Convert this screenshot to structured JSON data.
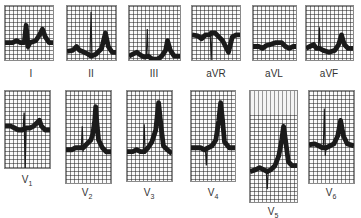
{
  "figure": {
    "type": "12-lead ECG strips",
    "limb_leads": [
      {
        "id": "I",
        "label": "I"
      },
      {
        "id": "II",
        "label": "II"
      },
      {
        "id": "III",
        "label": "III"
      },
      {
        "id": "aVR",
        "label": "aVR"
      },
      {
        "id": "aVL",
        "label": "aVL"
      },
      {
        "id": "aVF",
        "label": "aVF"
      }
    ],
    "precordial_leads": [
      {
        "id": "V1",
        "label": "V",
        "sub": "1"
      },
      {
        "id": "V2",
        "label": "V",
        "sub": "2"
      },
      {
        "id": "V3",
        "label": "V",
        "sub": "3"
      },
      {
        "id": "V4",
        "label": "V",
        "sub": "4"
      },
      {
        "id": "V5",
        "label": "V",
        "sub": "5"
      },
      {
        "id": "V6",
        "label": "V",
        "sub": "6"
      }
    ]
  },
  "colors": {
    "trace": "#1a1a1a",
    "grid": "#3a3a3a",
    "paper": "#fafafa",
    "label": "#333333"
  }
}
